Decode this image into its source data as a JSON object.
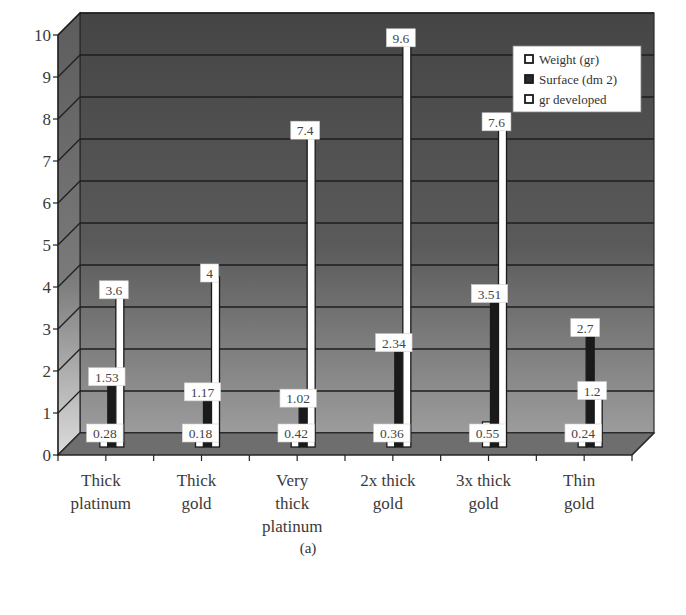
{
  "chart_data": {
    "type": "bar",
    "style": "3d-clustered-column",
    "title": "",
    "caption": "(a)",
    "xlabel": "",
    "ylabel": "",
    "ylim": [
      0,
      10
    ],
    "yticks": [
      "0",
      "1",
      "2",
      "3",
      "4",
      "5",
      "6",
      "7",
      "8",
      "9",
      "10"
    ],
    "grid": true,
    "legend_position": "top-right inside",
    "categories": [
      [
        "Thick",
        "platinum"
      ],
      [
        "Thick",
        "gold"
      ],
      [
        "Very",
        "thick",
        "platinum"
      ],
      [
        "2x thick",
        "gold"
      ],
      [
        "3x thick",
        "gold"
      ],
      [
        "Thin",
        "gold"
      ]
    ],
    "series": [
      {
        "name": "Weight (gr)",
        "color": "#ffffff",
        "values": [
          0.28,
          0.18,
          0.42,
          0.36,
          0.55,
          0.24
        ]
      },
      {
        "name": "Surface (dm 2)",
        "color": "#1a1a1a",
        "values": [
          1.53,
          1.17,
          1.02,
          2.34,
          3.51,
          2.7
        ]
      },
      {
        "name": "gr developed",
        "color": "#ffffff",
        "values": [
          3.6,
          4,
          7.4,
          9.6,
          7.6,
          1.2
        ]
      }
    ],
    "value_labels": [
      [
        "0.28",
        "1.53",
        "3.6"
      ],
      [
        "0.18",
        "1.17",
        "4"
      ],
      [
        "0.42",
        "1.02",
        "7.4"
      ],
      [
        "0.36",
        "2.34",
        "9.6"
      ],
      [
        "0.55",
        "3.51",
        "7.6"
      ],
      [
        "0.24",
        "2.7",
        "1.2"
      ]
    ]
  },
  "colors": {
    "wall_top": "#4a4a4a",
    "wall_bottom": "#9a9a9a",
    "side_wall_top": "#6a6a6a",
    "side_wall_bottom": "#d0d0d0",
    "floor": "#6b6b6b",
    "gridline": "#1e1e1e"
  }
}
